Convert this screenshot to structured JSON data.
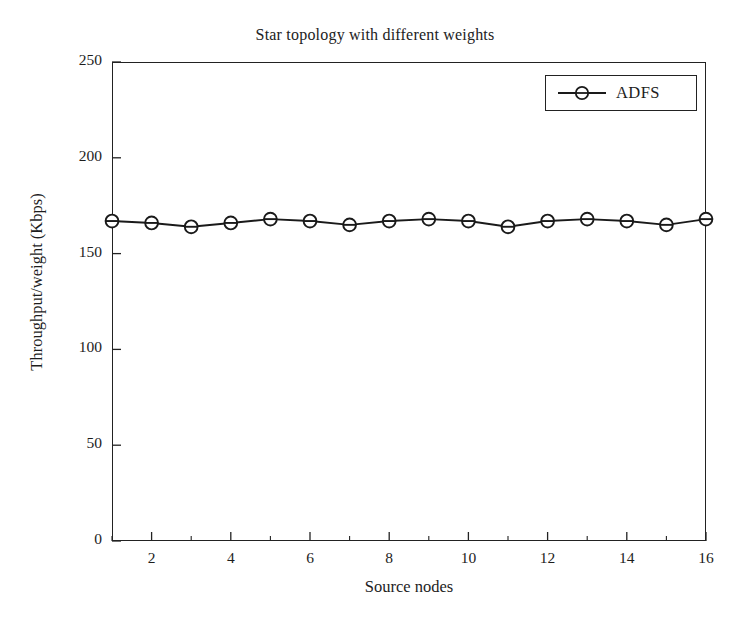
{
  "chart_data": {
    "type": "line",
    "title": "Star topology with different weights",
    "xlabel": "Source nodes",
    "ylabel": "Throughput/weight (Kbps)",
    "xlim": [
      1,
      16
    ],
    "ylim": [
      0,
      250
    ],
    "xticks": [
      2,
      4,
      6,
      8,
      10,
      12,
      14,
      16
    ],
    "xticks_minor": [
      1,
      3,
      5,
      7,
      9,
      11,
      13,
      15
    ],
    "yticks": [
      0,
      50,
      100,
      150,
      200,
      250
    ],
    "grid": false,
    "legend_position": "top-right",
    "x": [
      1,
      2,
      3,
      4,
      5,
      6,
      7,
      8,
      9,
      10,
      11,
      12,
      13,
      14,
      15,
      16
    ],
    "series": [
      {
        "name": "ADFS",
        "marker": "circle-open-with-line",
        "color": "#1a1a1a",
        "values": [
          167,
          166,
          164,
          166,
          168,
          167,
          165,
          167,
          168,
          167,
          164,
          167,
          168,
          167,
          165,
          168
        ]
      }
    ]
  },
  "legend": {
    "entries": [
      {
        "label": "ADFS"
      }
    ]
  },
  "axis_labels": {
    "x": "Source nodes",
    "y": "Throughput/weight (Kbps)"
  },
  "title": "Star topology with different weights",
  "tick_text": {
    "y": [
      "250",
      "200",
      "150",
      "100",
      "50",
      "0"
    ],
    "x": [
      "2",
      "4",
      "6",
      "8",
      "10",
      "12",
      "14",
      "16"
    ]
  }
}
